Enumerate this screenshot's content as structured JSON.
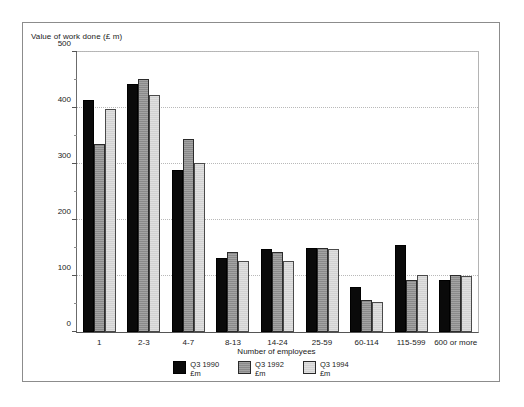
{
  "chart_data": {
    "type": "bar",
    "title": "",
    "ylabel": "Value of work done (£ m)",
    "xlabel": "Number of employees",
    "ylim": [
      0,
      500
    ],
    "yticks": [
      0,
      100,
      200,
      300,
      400,
      500
    ],
    "ytick_labels": [
      "0",
      "100",
      "200",
      "300",
      "400",
      "500"
    ],
    "yminor_step": 50,
    "grid": "horizontal-dotted",
    "legend_position": "bottom-center",
    "categories": [
      "1",
      "2-3",
      "4-7",
      "8-13",
      "14-24",
      "25-59",
      "60-114",
      "115-599",
      "600 or more"
    ],
    "series": [
      {
        "name": "Q3 1990",
        "unit": "£m",
        "color": "#0a0a0a",
        "values": [
          415,
          442,
          290,
          132,
          148,
          150,
          80,
          155,
          93
        ]
      },
      {
        "name": "Q3 1992",
        "unit": "£m",
        "color": "#8a8a8a",
        "values": [
          336,
          452,
          345,
          143,
          143,
          150,
          58,
          92,
          102
        ]
      },
      {
        "name": "Q3 1994",
        "unit": "£m",
        "color": "#d2d2d2",
        "values": [
          398,
          424,
          302,
          127,
          127,
          148,
          53,
          102,
          100
        ]
      }
    ]
  },
  "legend": {
    "items": [
      {
        "label": "Q3 1990",
        "unit": "£m"
      },
      {
        "label": "Q3 1992",
        "unit": "£m"
      },
      {
        "label": "Q3 1994",
        "unit": "£m"
      }
    ]
  }
}
